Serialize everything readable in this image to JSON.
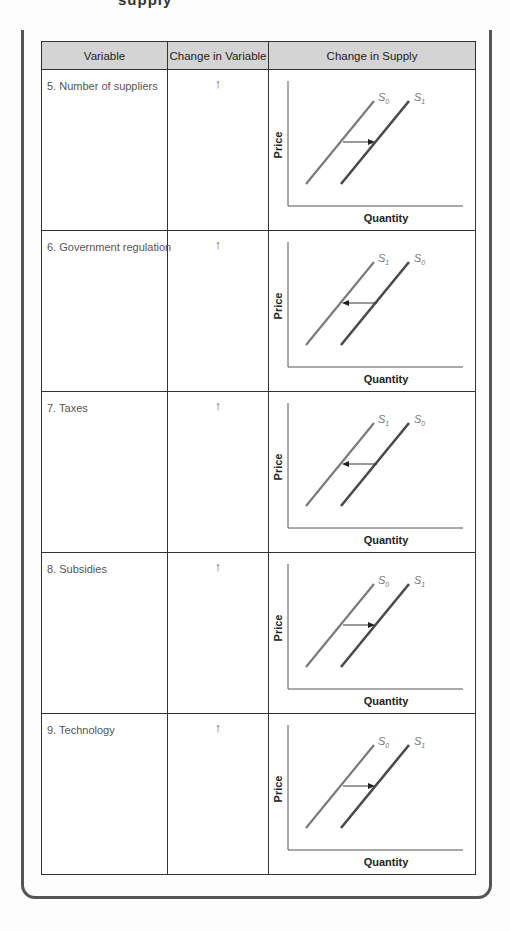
{
  "header_cutoff": "supply",
  "table": {
    "columns": [
      "Variable",
      "Change in Variable",
      "Change in Supply"
    ],
    "rows": [
      {
        "variable": "5.  Number of suppliers",
        "change": "↑",
        "graph": {
          "y_label": "Price",
          "x_label": "Quantity",
          "left_curve": "S0",
          "right_curve": "S1",
          "shift_direction": "right"
        }
      },
      {
        "variable": "6.  Government regulation",
        "change": "↑",
        "graph": {
          "y_label": "Price",
          "x_label": "Quantity",
          "left_curve": "S1",
          "right_curve": "S0",
          "shift_direction": "left"
        }
      },
      {
        "variable": "7.  Taxes",
        "change": "↑",
        "graph": {
          "y_label": "Price",
          "x_label": "Quantity",
          "left_curve": "S1",
          "right_curve": "S0",
          "shift_direction": "left"
        }
      },
      {
        "variable": "8.  Subsidies",
        "change": "↑",
        "graph": {
          "y_label": "Price",
          "x_label": "Quantity",
          "left_curve": "S0",
          "right_curve": "S1",
          "shift_direction": "right"
        }
      },
      {
        "variable": "9.  Technology",
        "change": "↑",
        "graph": {
          "y_label": "Price",
          "x_label": "Quantity",
          "left_curve": "S0",
          "right_curve": "S1",
          "shift_direction": "right"
        }
      }
    ]
  },
  "colors": {
    "header_bg": "#d4d4d4",
    "border": "#333333",
    "left_curve": "#7a7a7a",
    "right_curve": "#4a4a4a",
    "label_text": "#555555"
  }
}
